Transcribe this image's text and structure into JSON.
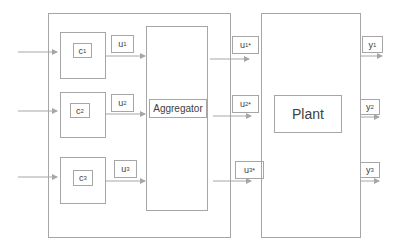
{
  "diagram": {
    "type": "block-diagram",
    "colors": {
      "line": "#a6a6a6",
      "text": "#404040",
      "background": "#ffffff"
    },
    "controller_group": {
      "controllers": [
        {
          "id": "c1",
          "label": "c",
          "sub": "1",
          "output": {
            "label": "u",
            "sub": "1"
          }
        },
        {
          "id": "c2",
          "label": "c",
          "sub": "2",
          "output": {
            "label": "u",
            "sub": "2"
          }
        },
        {
          "id": "c3",
          "label": "c",
          "sub": "3",
          "output": {
            "label": "u",
            "sub": "3"
          }
        }
      ],
      "aggregator": {
        "label": "Aggregator"
      }
    },
    "aggregated_outputs": [
      {
        "label": "u",
        "sub": "1",
        "sup": "*"
      },
      {
        "label": "u",
        "sub": "2",
        "sup": "*"
      },
      {
        "label": "u",
        "sub": "3",
        "sup": "*"
      }
    ],
    "plant": {
      "label": "Plant"
    },
    "plant_outputs": [
      {
        "label": "y",
        "sub": "1"
      },
      {
        "label": "y",
        "sub": "2"
      },
      {
        "label": "y",
        "sub": "3"
      }
    ]
  }
}
